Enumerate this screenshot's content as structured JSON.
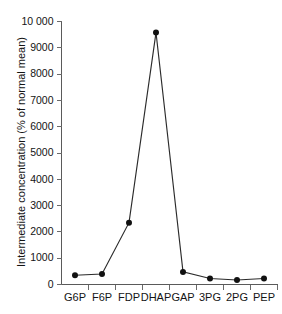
{
  "chart_data": {
    "type": "line",
    "title": "",
    "subtitle": "",
    "xlabel": "",
    "ylabel": "Intermediate concentration (% of normal mean)",
    "categories": [
      "G6P",
      "F6P",
      "FDP",
      "DHAP",
      "GAP",
      "3PG",
      "2PG",
      "PEP"
    ],
    "values": [
      350,
      400,
      2350,
      9580,
      480,
      230,
      170,
      230
    ],
    "series": [
      {
        "name": "Intermediate concentration",
        "values": [
          350,
          400,
          2350,
          9580,
          480,
          230,
          170,
          230
        ]
      }
    ],
    "ylim": [
      0,
      10000
    ],
    "ytick_values": [
      0,
      1000,
      2000,
      3000,
      4000,
      5000,
      6000,
      7000,
      8000,
      9000,
      10000
    ],
    "ytick_labels": [
      "0",
      "1000",
      "2000",
      "3000",
      "4000",
      "5000",
      "6000",
      "7000",
      "8000",
      "9000",
      "10 000"
    ],
    "grid": false,
    "legend": "none",
    "marker": "filled-circle",
    "line_color": "#2b2b2b",
    "marker_color": "#111111",
    "axis_color": "#5a5a5a",
    "background_color": "#ffffff"
  }
}
